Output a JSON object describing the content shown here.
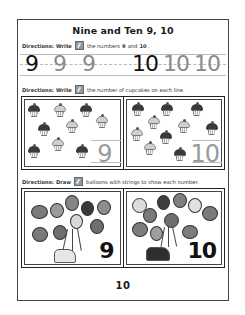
{
  "worksheet": {
    "title": "Nine and Ten 9, 10",
    "page_number": "10"
  },
  "section1": {
    "directions_label": "Directions:",
    "verb": "Write",
    "icon": "pencil-icon",
    "text_before": "the numbers",
    "num_a": "9",
    "and": "and",
    "num_b": "10",
    "period": ".",
    "trace_digits": [
      {
        "value": "9",
        "style": "dark"
      },
      {
        "value": "9",
        "style": "light"
      },
      {
        "value": "9",
        "style": "light"
      },
      {
        "value": "10",
        "style": "dark"
      },
      {
        "value": "10",
        "style": "light"
      },
      {
        "value": "10",
        "style": "light"
      }
    ]
  },
  "section2": {
    "directions_label": "Directions:",
    "verb": "Write",
    "icon": "pencil-icon",
    "text": "the number of cupcakes on each line.",
    "panels": [
      {
        "count": 9,
        "answer": "9"
      },
      {
        "count": 10,
        "answer": "10"
      }
    ]
  },
  "section3": {
    "directions_label": "Directions:",
    "verb": "Draw",
    "icon": "pencil-icon",
    "text": "balloons with strings to show each number.",
    "panels": [
      {
        "count": 9,
        "label": "9"
      },
      {
        "count": 10,
        "label": "10"
      }
    ]
  }
}
